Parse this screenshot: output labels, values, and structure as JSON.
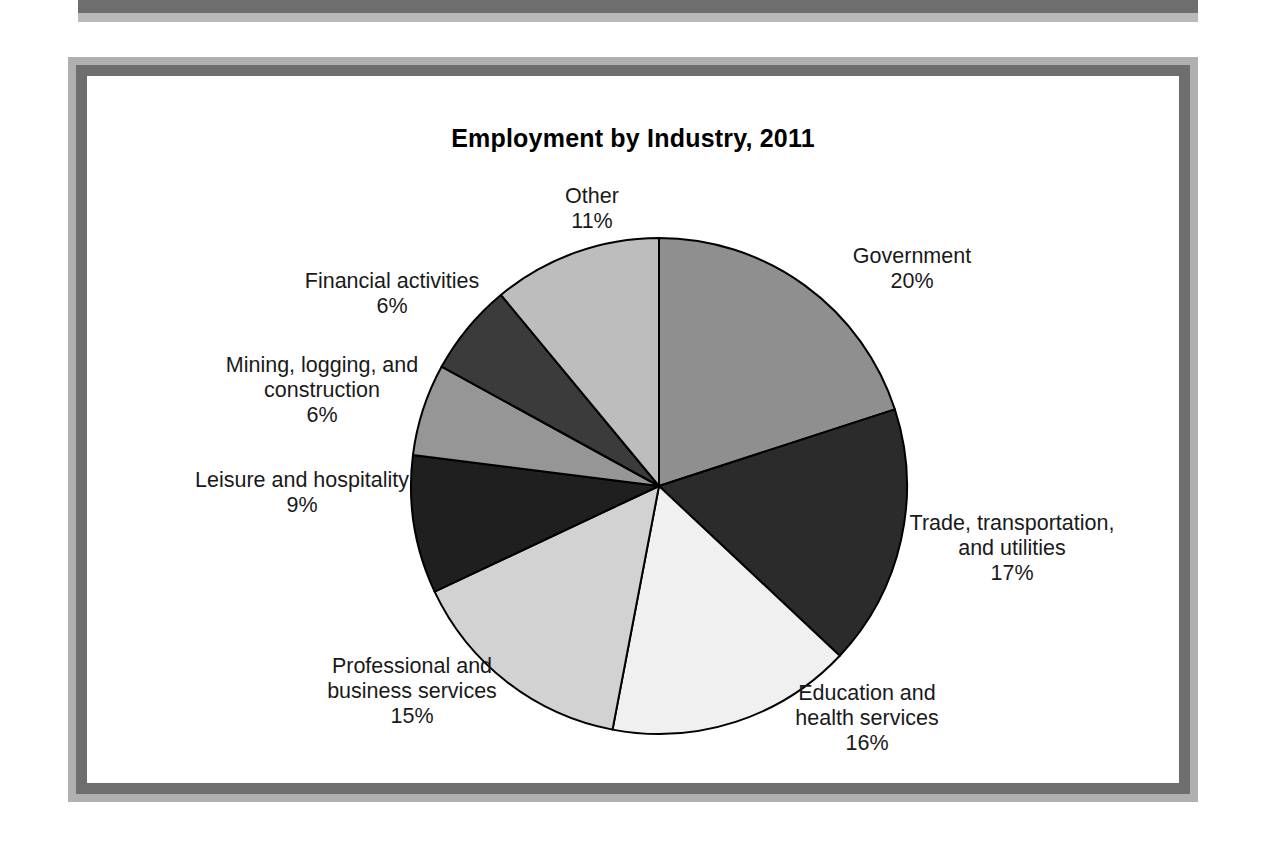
{
  "figure": {
    "frame_outer_color": "#b0b0b0",
    "frame_inner_color": "#6e6e6e",
    "background": "#ffffff"
  },
  "chart_data": {
    "type": "pie",
    "title": "Employment by Industry, 2011",
    "xlabel": "",
    "ylabel": "",
    "legend_position": "none",
    "labels_outside": true,
    "start_angle_deg": 0,
    "direction": "clockwise",
    "categories": [
      "Government",
      "Trade, transportation, and utilities",
      "Education and health services",
      "Professional and business services",
      "Leisure and hospitality",
      "Mining, logging, and construction",
      "Financial activities",
      "Other"
    ],
    "values": [
      20,
      17,
      16,
      15,
      9,
      6,
      6,
      11
    ],
    "value_labels": [
      "20%",
      "17%",
      "16%",
      "15%",
      "9%",
      "6%",
      "6%",
      "11%"
    ],
    "colors": [
      "#8f8f8f",
      "#2b2b2b",
      "#f0f0f0",
      "#d2d2d2",
      "#1f1f1f",
      "#969696",
      "#3b3b3b",
      "#bdbdbd"
    ],
    "slice_border_color": "#000000",
    "slices": [
      {
        "name": "Government",
        "value": 20,
        "value_label": "20%",
        "label_line1": "Government",
        "label_line2": "",
        "color": "#8f8f8f"
      },
      {
        "name": "Trade, transportation, and utilities",
        "value": 17,
        "value_label": "17%",
        "label_line1": "Trade, transportation,",
        "label_line2": "and utilities",
        "color": "#2b2b2b"
      },
      {
        "name": "Education and health services",
        "value": 16,
        "value_label": "16%",
        "label_line1": "Education and",
        "label_line2": "health services",
        "color": "#f0f0f0"
      },
      {
        "name": "Professional and business services",
        "value": 15,
        "value_label": "15%",
        "label_line1": "Professional and",
        "label_line2": "business services",
        "color": "#d2d2d2"
      },
      {
        "name": "Leisure and hospitality",
        "value": 9,
        "value_label": "9%",
        "label_line1": "Leisure and hospitality",
        "label_line2": "",
        "color": "#1f1f1f"
      },
      {
        "name": "Mining, logging, and construction",
        "value": 6,
        "value_label": "6%",
        "label_line1": "Mining, logging, and",
        "label_line2": "construction",
        "color": "#969696"
      },
      {
        "name": "Financial activities",
        "value": 6,
        "value_label": "6%",
        "label_line1": "Financial activities",
        "label_line2": "",
        "color": "#3b3b3b"
      },
      {
        "name": "Other",
        "value": 11,
        "value_label": "11%",
        "label_line1": "Other",
        "label_line2": "",
        "color": "#bdbdbd"
      }
    ]
  },
  "labels": {
    "government": "Government\n20%",
    "trade": "Trade, transportation,\nand utilities\n17%",
    "education": "Education and\nhealth services\n16%",
    "professional": "Professional and\nbusiness services\n15%",
    "leisure": "Leisure and hospitality\n9%",
    "mining": "Mining, logging, and\nconstruction\n6%",
    "financial": "Financial activities\n6%",
    "other": "Other\n11%"
  }
}
